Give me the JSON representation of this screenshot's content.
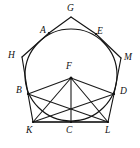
{
  "figure": {
    "canvas": {
      "width": 140,
      "height": 148,
      "background": "#ffffff"
    },
    "stroke_color": "#141414",
    "circle": {
      "cx": 71,
      "cy": 75,
      "r": 46
    },
    "labels": [
      {
        "id": "G",
        "text": "G",
        "x": 67,
        "y": 4,
        "name": "point-label-g"
      },
      {
        "id": "A",
        "text": "A",
        "x": 40,
        "y": 26,
        "name": "point-label-a"
      },
      {
        "id": "E",
        "text": "E",
        "x": 97,
        "y": 27,
        "name": "point-label-e"
      },
      {
        "id": "H",
        "text": "H",
        "x": 8,
        "y": 51,
        "name": "point-label-h"
      },
      {
        "id": "M",
        "text": "M",
        "x": 124,
        "y": 53,
        "name": "point-label-m"
      },
      {
        "id": "F",
        "text": "F",
        "x": 66,
        "y": 62,
        "name": "point-label-f"
      },
      {
        "id": "B",
        "text": "B",
        "x": 16,
        "y": 86,
        "name": "point-label-b"
      },
      {
        "id": "D",
        "text": "D",
        "x": 120,
        "y": 87,
        "name": "point-label-d"
      },
      {
        "id": "K",
        "text": "K",
        "x": 26,
        "y": 126,
        "name": "point-label-k"
      },
      {
        "id": "C",
        "text": "C",
        "x": 66,
        "y": 126,
        "name": "point-label-c"
      },
      {
        "id": "L",
        "text": "L",
        "x": 105,
        "y": 126,
        "name": "point-label-l"
      }
    ],
    "points": {
      "G": {
        "x": 71,
        "y": 17
      },
      "H": {
        "x": 22,
        "y": 57
      },
      "M": {
        "x": 121,
        "y": 58
      },
      "A": {
        "x": 49,
        "y": 33
      },
      "E": {
        "x": 96,
        "y": 34
      },
      "F": {
        "x": 71,
        "y": 78
      },
      "B": {
        "x": 28,
        "y": 94
      },
      "D": {
        "x": 114,
        "y": 94
      },
      "K": {
        "x": 33,
        "y": 122
      },
      "C": {
        "x": 71,
        "y": 122
      },
      "L": {
        "x": 108,
        "y": 122
      }
    },
    "segments": [
      {
        "from": "A",
        "to": "G",
        "name": "segment-ag"
      },
      {
        "from": "G",
        "to": "E",
        "name": "segment-ge"
      },
      {
        "from": "A",
        "to": "H",
        "name": "segment-ah"
      },
      {
        "from": "E",
        "to": "M",
        "name": "segment-em"
      },
      {
        "from": "H",
        "to": "B",
        "name": "segment-hb"
      },
      {
        "from": "M",
        "to": "D",
        "name": "segment-md"
      },
      {
        "from": "B",
        "to": "K",
        "name": "segment-bk"
      },
      {
        "from": "D",
        "to": "L",
        "name": "segment-dl"
      },
      {
        "from": "K",
        "to": "C",
        "name": "segment-kc"
      },
      {
        "from": "C",
        "to": "L",
        "name": "segment-cl"
      },
      {
        "from": "F",
        "to": "B",
        "name": "segment-fb"
      },
      {
        "from": "F",
        "to": "K",
        "name": "segment-fk"
      },
      {
        "from": "F",
        "to": "C",
        "name": "segment-fc"
      },
      {
        "from": "F",
        "to": "L",
        "name": "segment-fl"
      },
      {
        "from": "F",
        "to": "D",
        "name": "segment-fd"
      },
      {
        "from": "B",
        "to": "L",
        "name": "segment-bl"
      },
      {
        "from": "D",
        "to": "K",
        "name": "segment-dk"
      }
    ]
  }
}
